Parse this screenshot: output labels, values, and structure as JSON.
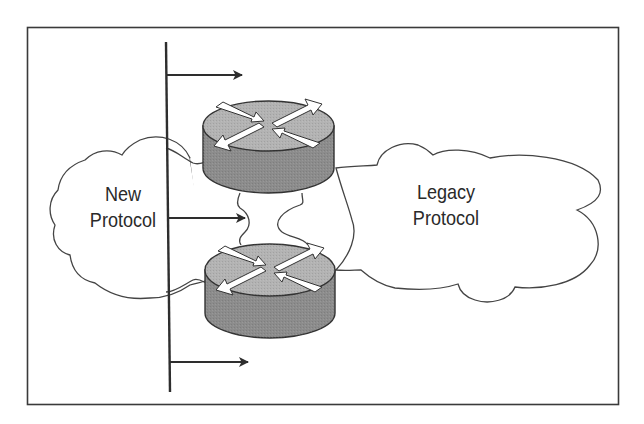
{
  "diagram": {
    "type": "network-protocol-migration",
    "colors": {
      "frame": "#3a3a3a",
      "line": "#2e2e2e",
      "cloud_stroke": "#444444",
      "router_top": "#b3b3b3",
      "router_side": "#8c8c8c",
      "router_stroke": "#333333",
      "router_arrows": "#ffffff"
    },
    "clouds": [
      {
        "id": "new-protocol",
        "label_line1": "New",
        "label_line2": "Protocol"
      },
      {
        "id": "legacy-protocol",
        "label_line1": "Legacy",
        "label_line2": "Protocol"
      }
    ],
    "routers": [
      {
        "id": "router-top",
        "icon": "router-icon"
      },
      {
        "id": "router-bottom",
        "icon": "router-icon"
      }
    ],
    "bus": {
      "arrows": [
        {
          "id": "arrow-top",
          "direction": "right"
        },
        {
          "id": "arrow-middle",
          "direction": "right"
        },
        {
          "id": "arrow-bottom",
          "direction": "right"
        }
      ]
    }
  }
}
